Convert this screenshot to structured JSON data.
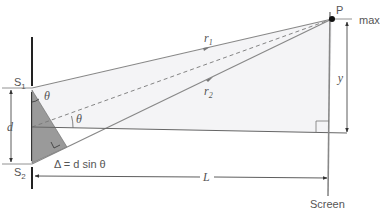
{
  "diagram": {
    "labels": {
      "slit1": "S",
      "slit1_sub": "1",
      "slit2": "S",
      "slit2_sub": "2",
      "point": "P",
      "max": "max",
      "r1": "r",
      "r1_sub": "1",
      "r2": "r",
      "r2_sub": "2",
      "theta_top": "θ",
      "theta_mid": "θ",
      "d": "d",
      "y": "y",
      "L": "L",
      "path_difference": "Δ = d sin θ",
      "screen": "Screen"
    },
    "colors": {
      "line": "#777777",
      "dark_line": "#222222",
      "triangle_fill": "#9a9a9a",
      "region_fill": "#f3f3f5",
      "dot": "#111111"
    }
  }
}
